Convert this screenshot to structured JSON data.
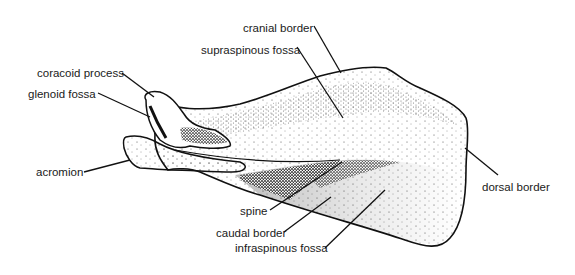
{
  "diagram": {
    "ink_color": "#111111",
    "background": "#ffffff",
    "labels": [
      {
        "id": "cranial-border",
        "text": "cranial border",
        "x": 243,
        "y": 22
      },
      {
        "id": "supraspinous-fossa",
        "text": "supraspinous fossa",
        "x": 201,
        "y": 44
      },
      {
        "id": "coracoid-process",
        "text": "coracoid process",
        "x": 37,
        "y": 67
      },
      {
        "id": "glenoid-fossa",
        "text": "glenoid fossa",
        "x": 28,
        "y": 88
      },
      {
        "id": "acromion",
        "text": "acromion",
        "x": 36,
        "y": 165
      },
      {
        "id": "dorsal-border",
        "text": "dorsal border",
        "x": 482,
        "y": 181
      },
      {
        "id": "spine",
        "text": "spine",
        "x": 240,
        "y": 205
      },
      {
        "id": "caudal-border",
        "text": "caudal border",
        "x": 216,
        "y": 228
      },
      {
        "id": "infraspinous-fossa",
        "text": "infraspinous fossa",
        "x": 235,
        "y": 243
      }
    ]
  }
}
